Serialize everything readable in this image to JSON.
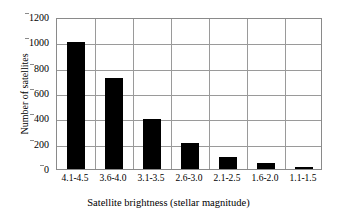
{
  "chart_data": {
    "type": "bar",
    "title": "",
    "xlabel": "Satellite brightness (stellar magnitude)",
    "ylabel": "Number of satellites",
    "categories": [
      "4.1-4.5",
      "3.6-4.0",
      "3.1-3.5",
      "2.6-3.0",
      "2.1-2.5",
      "1.6-2.0",
      "1.1-1.5"
    ],
    "values": [
      1005,
      720,
      395,
      205,
      95,
      50,
      15
    ],
    "ylim": [
      0,
      1200
    ],
    "ytick_values": [
      0,
      200,
      400,
      600,
      800,
      1000,
      1200
    ],
    "ytick_labels": [
      "0",
      "200",
      "400",
      "600",
      "800",
      "1000",
      "1200"
    ],
    "grid": "horizontal-and-vertical",
    "legend": "none",
    "bar_color": "#000000",
    "grid_color": "#9a9a9a",
    "axis_color": "#8a8a8a",
    "background_color": "#ffffff"
  },
  "axes": {
    "x_title": "Satellite brightness (stellar magnitude)",
    "y_title": "Number of satellites"
  },
  "yticks": [
    {
      "label": "1200",
      "value": 1200
    },
    {
      "label": "1000",
      "value": 1000
    },
    {
      "label": "800",
      "value": 800
    },
    {
      "label": "600",
      "value": 600
    },
    {
      "label": "400",
      "value": 400
    },
    {
      "label": "200",
      "value": 200
    },
    {
      "label": "0",
      "value": 0
    }
  ],
  "xticks": [
    {
      "label": "4.1-4.5"
    },
    {
      "label": "3.6-4.0"
    },
    {
      "label": "3.1-3.5"
    },
    {
      "label": "2.6-3.0"
    },
    {
      "label": "2.1-2.5"
    },
    {
      "label": "1.6-2.0"
    },
    {
      "label": "1.1-1.5"
    }
  ]
}
